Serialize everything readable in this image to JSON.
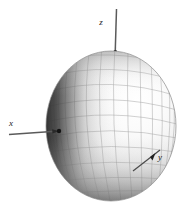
{
  "figure": {
    "title": "",
    "type": "3d-ellipsoid-with-coordinate-axes",
    "background_color": "#ffffff",
    "axes": [
      {
        "id": "z",
        "label": "z",
        "label_x": 101,
        "label_y": 25,
        "orientation": "vertical-up",
        "line": {
          "x1": 116.5,
          "y1": 9,
          "x2": 115.2,
          "y2": 53
        },
        "color": "#555555",
        "has_arrow": false
      },
      {
        "id": "x",
        "label": "x",
        "label_x": 11,
        "label_y": 126,
        "orientation": "horizontal-left",
        "line": {
          "x1": 9,
          "y1": 134,
          "x2": 59,
          "y2": 131
        },
        "color": "#555555",
        "has_arrow": true
      },
      {
        "id": "y",
        "label": "y",
        "label_x": 157,
        "label_y": 160,
        "orientation": "diagonal-lower-right",
        "line": {
          "x1": 133,
          "y1": 171,
          "x2": 160,
          "y2": 150
        },
        "color": "#555555",
        "has_arrow": true
      }
    ],
    "ellipsoid": {
      "center_x": 111,
      "center_y": 126,
      "radius_x": 65,
      "radius_y": 75,
      "surface_color_light": "#fdfdfd",
      "surface_color_mid": "#c9c9c9",
      "surface_color_dark": "#3a3a3a",
      "mesh_line_color": "#a8a8a8",
      "outline_color": "#8a8a8a",
      "mesh_meridians": 16,
      "mesh_parallels": 12,
      "light_direction": "upper-right"
    },
    "origin_marker": {
      "x": 59,
      "y": 131,
      "color": "#202020",
      "radius": 2.2
    }
  }
}
